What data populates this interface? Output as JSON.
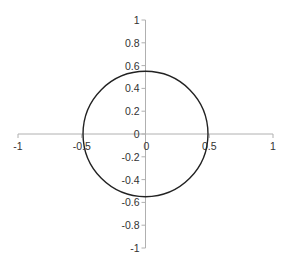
{
  "chart_data": {
    "type": "scatter",
    "title": "",
    "xlabel": "",
    "ylabel": "",
    "xlim": [
      -1,
      1
    ],
    "ylim": [
      -1,
      1
    ],
    "grid": false,
    "legend": null,
    "x_ticks": [
      -1,
      -0.5,
      0,
      0.5,
      1
    ],
    "x_tick_labels": [
      "-1",
      "-0.5",
      "0",
      "0.5",
      "1"
    ],
    "y_ticks": [
      1,
      0.8,
      0.6,
      0.4,
      0.2,
      0,
      -0.2,
      -0.4,
      -0.6,
      -0.8,
      -1
    ],
    "y_tick_labels": [
      "1",
      "0.8",
      "0.6",
      "0.4",
      "0.2",
      "0",
      "-0.2",
      "-0.4",
      "-0.6",
      "-0.8",
      "-1"
    ],
    "series": [
      {
        "name": "closed curve (circle)",
        "shape": "ellipse",
        "center": [
          0,
          0
        ],
        "x_radius": 0.49,
        "y_radius": 0.55,
        "color": "#222222",
        "sample_points": [
          [
            0.49,
            0
          ],
          [
            0.35,
            0.39
          ],
          [
            0,
            0.55
          ],
          [
            -0.35,
            0.39
          ],
          [
            -0.49,
            0
          ],
          [
            -0.35,
            -0.39
          ],
          [
            0,
            -0.55
          ],
          [
            0.35,
            -0.39
          ],
          [
            0.49,
            0
          ]
        ]
      }
    ]
  },
  "colors": {
    "axis": "#b0b0b0",
    "curve": "#222222",
    "label": "#333333"
  }
}
